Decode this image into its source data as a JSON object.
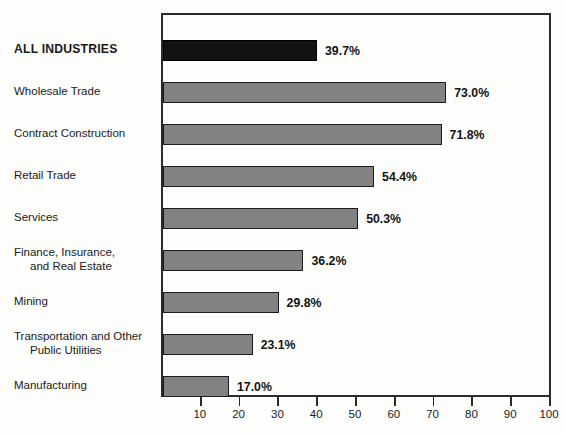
{
  "chart_data": {
    "type": "bar",
    "orientation": "horizontal",
    "title": "",
    "subtitle": "",
    "xlabel": "",
    "ylabel": "",
    "xlim": [
      0,
      100
    ],
    "grid": false,
    "legend": null,
    "categories": [
      "ALL INDUSTRIES",
      "Wholesale Trade",
      "Contract Construction",
      "Retail Trade",
      "Services",
      "Finance, Insurance, and Real Estate",
      "Mining",
      "Transportation and Other Public Utilities",
      "Manufacturing"
    ],
    "values": [
      39.7,
      73.0,
      71.8,
      54.4,
      50.3,
      36.2,
      29.8,
      23.1,
      17.0
    ],
    "value_labels": [
      "39.7%",
      "73.0%",
      "71.8%",
      "54.4%",
      "50.3%",
      "36.2%",
      "29.8%",
      "23.1%",
      "17.0%"
    ],
    "xticks": [
      10,
      20,
      30,
      40,
      50,
      60,
      70,
      80,
      90,
      100
    ],
    "xtick_labels": [
      "10",
      "20",
      "30",
      "40",
      "50",
      "60",
      "70",
      "80",
      "90",
      "100"
    ],
    "colors": {
      "bar_fill": "#828282",
      "bar_fill_highlight": "#121212",
      "bar_stroke": "#1c1c1c",
      "axis": "#2b2b2b",
      "text": "#1a1a1a",
      "background": "#fdfdfc"
    }
  },
  "bars": [
    {
      "label_line1": "ALL INDUSTRIES",
      "label_line2": "",
      "value": 39.7,
      "value_label": "39.7%",
      "emphasis": true
    },
    {
      "label_line1": "Wholesale Trade",
      "label_line2": "",
      "value": 73.0,
      "value_label": "73.0%",
      "emphasis": false
    },
    {
      "label_line1": "Contract Construction",
      "label_line2": "",
      "value": 71.8,
      "value_label": "71.8%",
      "emphasis": false
    },
    {
      "label_line1": "Retail Trade",
      "label_line2": "",
      "value": 54.4,
      "value_label": "54.4%",
      "emphasis": false
    },
    {
      "label_line1": "Services",
      "label_line2": "",
      "value": 50.3,
      "value_label": "50.3%",
      "emphasis": false
    },
    {
      "label_line1": "Finance, Insurance,",
      "label_line2": "and Real Estate",
      "value": 36.2,
      "value_label": "36.2%",
      "emphasis": false
    },
    {
      "label_line1": "Mining",
      "label_line2": "",
      "value": 29.8,
      "value_label": "29.8%",
      "emphasis": false
    },
    {
      "label_line1": "Transportation and Other",
      "label_line2": "Public Utilities",
      "value": 23.1,
      "value_label": "23.1%",
      "emphasis": false
    },
    {
      "label_line1": "Manufacturing",
      "label_line2": "",
      "value": 17.0,
      "value_label": "17.0%",
      "emphasis": false
    }
  ]
}
